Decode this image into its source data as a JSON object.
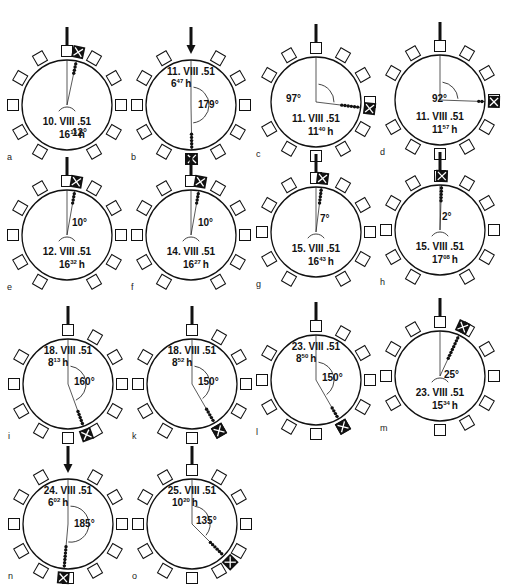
{
  "figure": {
    "panels": [
      {
        "id": "a",
        "cx": 67,
        "cy": 105,
        "date": "10. VIII .51",
        "time_h": "16",
        "time_min": "13",
        "angle": "12°",
        "target_deg": 12,
        "textPos": "bottom",
        "angleLabelPos": [
          72,
          136
        ],
        "dots": 4,
        "arc": "small"
      },
      {
        "id": "b",
        "cx": 191,
        "cy": 105,
        "date": "11. VIII .51",
        "time_h": "6",
        "time_min": "47",
        "angle": "179°",
        "target_deg": 179,
        "textPos": "top",
        "angleLabelPos": [
          198,
          108
        ],
        "dots": 5,
        "arc": "large"
      },
      {
        "id": "c",
        "cx": 316,
        "cy": 102,
        "date": "11. VIII .51",
        "time_h": "11",
        "time_min": "40",
        "angle": "97°",
        "target_deg": 97,
        "textPos": "bottom",
        "angleLabelPos": [
          286,
          102
        ],
        "dots": 6,
        "arc": "medium"
      },
      {
        "id": "d",
        "cx": 440,
        "cy": 100,
        "date": "11. VIII .51",
        "time_h": "11",
        "time_min": "57",
        "angle": "92°",
        "target_deg": 92,
        "textPos": "bottom",
        "angleLabelPos": [
          432,
          102
        ],
        "dots": 2,
        "arc": "medium"
      },
      {
        "id": "e",
        "cx": 67,
        "cy": 235,
        "date": "12. VIII .51",
        "time_h": "16",
        "time_min": "32",
        "angle": "10°",
        "target_deg": 10,
        "textPos": "bottom",
        "angleLabelPos": [
          72,
          226
        ],
        "dots": 4,
        "arc": "small"
      },
      {
        "id": "f",
        "cx": 191,
        "cy": 235,
        "date": "14. VIII .51",
        "time_h": "16",
        "time_min": "27",
        "angle": "10°",
        "target_deg": 10,
        "textPos": "bottom",
        "angleLabelPos": [
          198,
          226
        ],
        "dots": 4,
        "arc": "small"
      },
      {
        "id": "g",
        "cx": 316,
        "cy": 232,
        "date": "15. VIII .51",
        "time_h": "16",
        "time_min": "43",
        "angle": "7°",
        "target_deg": 7,
        "textPos": "bottom",
        "angleLabelPos": [
          320,
          222
        ],
        "dots": 5,
        "arc": "small"
      },
      {
        "id": "h",
        "cx": 440,
        "cy": 230,
        "date": "15. VIII .51",
        "time_h": "17",
        "time_min": "08",
        "angle": "2°",
        "target_deg": 2,
        "textPos": "bottom",
        "angleLabelPos": [
          442,
          220
        ],
        "dots": 5,
        "arc": "small"
      },
      {
        "id": "i",
        "cx": 68,
        "cy": 384,
        "date": "18. VIII .51",
        "time_h": "8",
        "time_min": "13",
        "angle": "160°",
        "target_deg": 160,
        "textPos": "top",
        "angleLabelPos": [
          74,
          385
        ],
        "dots": 5,
        "arc": "large"
      },
      {
        "id": "k",
        "cx": 192,
        "cy": 384,
        "date": "18. VIII .51",
        "time_h": "8",
        "time_min": "52",
        "angle": "150°",
        "target_deg": 150,
        "textPos": "top",
        "angleLabelPos": [
          198,
          385
        ],
        "dots": 5,
        "arc": "large"
      },
      {
        "id": "l",
        "cx": 316,
        "cy": 380,
        "date": "23. VIII .51",
        "time_h": "8",
        "time_min": "50",
        "angle": "150°",
        "target_deg": 150,
        "textPos": "top",
        "angleLabelPos": [
          322,
          381
        ],
        "dots": 4,
        "arc": "large"
      },
      {
        "id": "m",
        "cx": 440,
        "cy": 376,
        "date": "23. VIII .51",
        "time_h": "15",
        "time_min": "34",
        "angle": "25°",
        "target_deg": 25,
        "textPos": "bottom",
        "angleLabelPos": [
          444,
          378
        ],
        "dots": 8,
        "arc": "small"
      },
      {
        "id": "n",
        "cx": 68,
        "cy": 524,
        "date": "24. VIII .51",
        "time_h": "6",
        "time_min": "02",
        "angle": "185°",
        "target_deg": 185,
        "textPos": "top",
        "angleLabelPos": [
          74,
          527
        ],
        "dots": 7,
        "arc": "large"
      },
      {
        "id": "o",
        "cx": 192,
        "cy": 524,
        "date": "25. VIII .51",
        "time_h": "10",
        "time_min": "20",
        "angle": "135°",
        "target_deg": 135,
        "textPos": "top",
        "angleLabelPos": [
          196,
          524
        ],
        "dots": 6,
        "arc": "large"
      }
    ],
    "hour_suffix": "h",
    "box_count": 12,
    "arena_radius": 45
  }
}
